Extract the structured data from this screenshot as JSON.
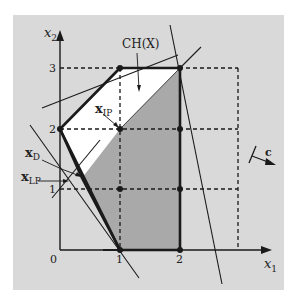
{
  "figure": {
    "axes": {
      "x_label": "x",
      "x_sub": "1",
      "y_label": "x",
      "y_sub": "2",
      "origin_label": "0",
      "x_ticks": [
        "1",
        "2"
      ],
      "y_ticks": [
        "1",
        "2",
        "3"
      ]
    },
    "labels": {
      "hull": "CH(X)",
      "x_ip": "x",
      "x_ip_sub": "IP",
      "x_d": "x",
      "x_d_sub": "D",
      "x_lp": "x",
      "x_lp_sub": "LP",
      "objective": "c"
    },
    "colors": {
      "frame_bg": "#d9d9d9",
      "lp_region": "#ffffff",
      "hull_region": "#a9a9a9",
      "line": "#1a1a1a"
    },
    "integer_points": [
      [
        0,
        2
      ],
      [
        1,
        3
      ],
      [
        1,
        2
      ],
      [
        2,
        3
      ],
      [
        2,
        2
      ],
      [
        1,
        1
      ],
      [
        2,
        1
      ],
      [
        1,
        0
      ],
      [
        2,
        0
      ]
    ]
  }
}
